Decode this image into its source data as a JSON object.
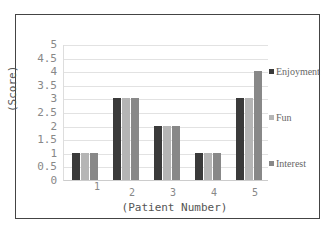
{
  "chart_data": {
    "type": "bar",
    "title": "",
    "xlabel": "(Patient Number)",
    "ylabel": "(Score)",
    "ylim": [
      0,
      5
    ],
    "yticks": [
      "0",
      "0.5",
      "1",
      "1.5",
      "2",
      "2.5",
      "3",
      "3.5",
      "4",
      "4.5",
      "5"
    ],
    "categories": [
      "1",
      "2",
      "3",
      "4",
      "5"
    ],
    "series": [
      {
        "name": "Enjoyment",
        "color": "#3a3a3a",
        "values": [
          1,
          3,
          2,
          1,
          3
        ]
      },
      {
        "name": "Fun",
        "color": "#b5b5b5",
        "values": [
          1,
          3,
          2,
          1,
          3
        ]
      },
      {
        "name": "Interest",
        "color": "#888888",
        "values": [
          1,
          3,
          2,
          1,
          4
        ]
      }
    ],
    "grid": true,
    "legend_position": "right"
  },
  "legend": {
    "items": [
      {
        "label": "Enjoyment",
        "color": "#3a3a3a"
      },
      {
        "label": "Fun",
        "color": "#b5b5b5"
      },
      {
        "label": "Interest",
        "color": "#888888"
      }
    ]
  }
}
